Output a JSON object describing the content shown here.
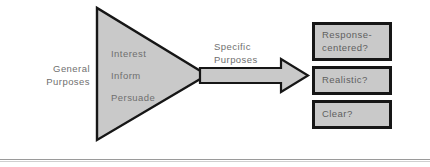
{
  "figure": {
    "colors": {
      "shape_fill": "#c9c9c9",
      "shape_stroke": "#161616",
      "text_gray": "#6f6f6f",
      "rule_gray": "#9a9a9a",
      "background": "#ffffff"
    }
  },
  "general_purposes": {
    "label": "General\nPurposes",
    "items": [
      {
        "label": "Interest"
      },
      {
        "label": "Inform"
      },
      {
        "label": "Persuade"
      }
    ]
  },
  "specific_purposes": {
    "label": "Specific\nPurposes"
  },
  "outcomes": [
    {
      "label": "Response-\ncentered?"
    },
    {
      "label": "Realistic?"
    },
    {
      "label": "Clear?"
    }
  ]
}
